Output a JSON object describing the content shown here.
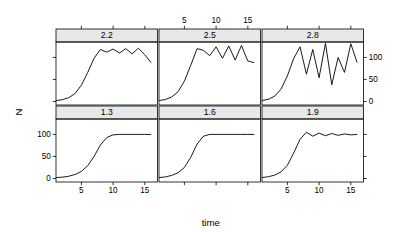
{
  "figure": {
    "type": "trellis-lattice-multipanel",
    "ylabel": "N",
    "xlabel": "time",
    "background": "#FFFFFF",
    "strip_fill": "#E8E8E8",
    "line_color": "#000000",
    "border_color": "#000000"
  },
  "axes": {
    "x_ticks": [
      5,
      10,
      15
    ],
    "x_tick_labels": [
      "5",
      "10",
      "15"
    ],
    "x_range": [
      1,
      17
    ],
    "y_ticks": [
      0,
      50,
      100
    ],
    "y_tick_labels": [
      "0",
      "50",
      "100"
    ],
    "y_range": [
      -8,
      135
    ],
    "top_axis_panel": "2.5",
    "bottom_axis_panels": [
      "1.3",
      "1.9"
    ],
    "left_axis_row": "bottom",
    "right_axis_row": "top"
  },
  "chart_data": {
    "type": "line",
    "title": "",
    "subtitle": "",
    "xlabel": "time",
    "ylabel": "N",
    "xlim": [
      1,
      17
    ],
    "ylim": [
      -8,
      135
    ],
    "grid": false,
    "legend": "none",
    "panel_variable": "r",
    "panel_layout": {
      "rows": 2,
      "cols": 3,
      "top_row": [
        "2.2",
        "2.5",
        "2.8"
      ],
      "bottom_row": [
        "1.3",
        "1.6",
        "1.9"
      ]
    },
    "x": [
      1,
      2,
      3,
      4,
      5,
      6,
      7,
      8,
      9,
      10,
      11,
      12,
      13,
      14,
      15,
      16
    ],
    "series": [
      {
        "name": "2.2",
        "panel": "2.2",
        "strip_label": "2.2",
        "values": [
          2,
          4,
          8.5,
          18,
          37,
          66,
          98,
          118,
          112,
          119,
          110,
          120,
          108,
          121,
          106,
          88
        ]
      },
      {
        "name": "2.5",
        "panel": "2.5",
        "strip_label": "2.5",
        "values": [
          2,
          4.5,
          10,
          22,
          46,
          82,
          120,
          116,
          104,
          124,
          98,
          126,
          94,
          127,
          92,
          88
        ]
      },
      {
        "name": "2.8",
        "panel": "2.8",
        "strip_label": "2.8",
        "values": [
          2,
          5,
          12,
          28,
          58,
          98,
          124,
          62,
          118,
          54,
          132,
          38,
          100,
          66,
          131,
          88
        ]
      },
      {
        "name": "1.3",
        "panel": "1.3",
        "strip_label": "1.3",
        "values": [
          2,
          3,
          5,
          9,
          16,
          29,
          50,
          76,
          93,
          99,
          100,
          100,
          100,
          100,
          100,
          100
        ]
      },
      {
        "name": "1.6",
        "panel": "1.6",
        "strip_label": "1.6",
        "values": [
          2,
          3.5,
          7,
          13,
          25,
          48,
          78,
          96,
          100,
          100,
          100,
          100,
          100,
          100,
          100,
          100
        ]
      },
      {
        "name": "1.9",
        "panel": "1.9",
        "strip_label": "1.9",
        "values": [
          2,
          4,
          7.5,
          15,
          30,
          58,
          89,
          105,
          96,
          103,
          97,
          102,
          98,
          101,
          99,
          100
        ]
      }
    ]
  },
  "panels": [
    {
      "id": "panel-2-2",
      "strip_label": "2.2",
      "row": 0,
      "col": 0
    },
    {
      "id": "panel-2-5",
      "strip_label": "2.5",
      "row": 0,
      "col": 1
    },
    {
      "id": "panel-2-8",
      "strip_label": "2.8",
      "row": 0,
      "col": 2
    },
    {
      "id": "panel-1-3",
      "strip_label": "1.3",
      "row": 1,
      "col": 0
    },
    {
      "id": "panel-1-6",
      "strip_label": "1.6",
      "row": 1,
      "col": 1
    },
    {
      "id": "panel-1-9",
      "strip_label": "1.9",
      "row": 1,
      "col": 2
    }
  ]
}
